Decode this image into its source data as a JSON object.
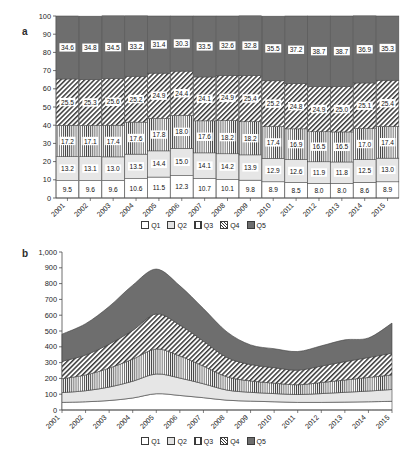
{
  "figure": {
    "panels": [
      {
        "id": "a",
        "label": "a"
      },
      {
        "id": "b",
        "label": "b"
      }
    ]
  },
  "legend": {
    "items": [
      {
        "key": "Q1",
        "label": "Q1",
        "swatch": "white-square-icon"
      },
      {
        "key": "Q2",
        "label": "Q2",
        "swatch": "light-gray-square-icon"
      },
      {
        "key": "Q3",
        "label": "Q3",
        "swatch": "vertical-stripe-square-icon"
      },
      {
        "key": "Q4",
        "label": "Q4",
        "swatch": "diagonal-hatch-square-icon"
      },
      {
        "key": "Q5",
        "label": "Q5",
        "swatch": "dark-gray-square-icon"
      }
    ]
  },
  "chart_data": [
    {
      "id": "panel-a",
      "type": "bar",
      "stacked": true,
      "percent": true,
      "title": "",
      "panel_label": "a",
      "xlabel": "",
      "ylabel": "",
      "ylim": [
        0,
        100
      ],
      "yticks": [
        0,
        10,
        20,
        30,
        40,
        50,
        60,
        70,
        80,
        90,
        100
      ],
      "ytick_labels": [
        "0",
        "10",
        "20",
        "30",
        "40",
        "50",
        "60",
        "70",
        "80",
        "90",
        "100"
      ],
      "grid": false,
      "legend_position": "bottom",
      "categories": [
        "2001",
        "2002",
        "2003",
        "2004",
        "2005",
        "2006",
        "2007",
        "2008",
        "2009",
        "2010",
        "2011",
        "2012",
        "2013",
        "2014",
        "2015"
      ],
      "series": [
        {
          "name": "Q1",
          "fill": "white",
          "values": [
            9.5,
            9.6,
            9.6,
            10.6,
            11.5,
            12.3,
            10.7,
            10.1,
            9.8,
            8.9,
            8.5,
            8.0,
            8.0,
            8.6,
            8.9
          ]
        },
        {
          "name": "Q2",
          "fill": "light-gray",
          "values": [
            13.2,
            13.1,
            13.0,
            13.5,
            14.4,
            15.0,
            14.1,
            14.2,
            13.9,
            12.9,
            12.6,
            11.9,
            11.8,
            12.5,
            13.0
          ]
        },
        {
          "name": "Q3",
          "fill": "vertical-stripe",
          "values": [
            17.2,
            17.1,
            17.4,
            17.6,
            17.8,
            18.0,
            17.6,
            18.2,
            18.2,
            17.4,
            16.9,
            16.5,
            16.5,
            17.0,
            17.4
          ]
        },
        {
          "name": "Q4",
          "fill": "diagonal-hatch",
          "values": [
            25.5,
            25.3,
            25.6,
            25.2,
            24.9,
            24.4,
            24.1,
            24.9,
            25.4,
            25.2,
            24.8,
            24.9,
            25.0,
            25.1,
            25.4
          ]
        },
        {
          "name": "Q5",
          "fill": "dark-gray",
          "values": [
            34.6,
            34.8,
            34.5,
            33.2,
            31.4,
            30.3,
            33.5,
            32.6,
            32.8,
            35.5,
            37.2,
            38.7,
            38.7,
            36.9,
            35.3
          ]
        }
      ]
    },
    {
      "id": "panel-b",
      "type": "area",
      "stacked": true,
      "percent": false,
      "title": "",
      "panel_label": "b",
      "xlabel": "",
      "ylabel": "",
      "ylim": [
        0,
        1000
      ],
      "yticks": [
        0,
        100,
        200,
        300,
        400,
        500,
        600,
        700,
        800,
        900,
        1000
      ],
      "ytick_labels": [
        "0",
        "100",
        "200",
        "300",
        "400",
        "500",
        "600",
        "700",
        "800",
        "900",
        "1,000"
      ],
      "grid": false,
      "legend_position": "bottom",
      "categories": [
        "2001",
        "2002",
        "2003",
        "2004",
        "2005",
        "2006",
        "2007",
        "2008",
        "2009",
        "2010",
        "2011",
        "2012",
        "2013",
        "2014",
        "2015"
      ],
      "series": [
        {
          "name": "Q1",
          "fill": "white",
          "values": [
            48,
            52,
            60,
            76,
            103,
            92,
            78,
            62,
            56,
            52,
            48,
            48,
            50,
            52,
            55
          ]
        },
        {
          "name": "Q2",
          "fill": "light-gray",
          "values": [
            62,
            70,
            85,
            106,
            125,
            110,
            88,
            64,
            56,
            52,
            50,
            56,
            62,
            68,
            75
          ]
        },
        {
          "name": "Q3",
          "fill": "vertical-stripe",
          "values": [
            88,
            100,
            120,
            140,
            158,
            140,
            112,
            84,
            72,
            66,
            62,
            70,
            78,
            86,
            92
          ]
        },
        {
          "name": "Q4",
          "fill": "diagonal-hatch",
          "values": [
            110,
            126,
            152,
            182,
            222,
            196,
            158,
            122,
            104,
            98,
            92,
            104,
            116,
            126,
            138
          ]
        },
        {
          "name": "Q5",
          "fill": "dark-gray",
          "values": [
            172,
            198,
            238,
            286,
            284,
            248,
            206,
            162,
            124,
            120,
            118,
            128,
            138,
            124,
            190
          ]
        }
      ],
      "totals": [
        480,
        546,
        655,
        790,
        892,
        786,
        642,
        494,
        412,
        388,
        370,
        406,
        444,
        456,
        550
      ]
    }
  ]
}
